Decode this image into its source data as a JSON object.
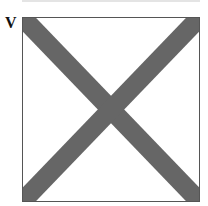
{
  "flag": {
    "letter": "V",
    "name": "signal-flag-victor",
    "field_color": "#ffffff",
    "saltire_color": "#666666",
    "border_color": "#555555"
  }
}
